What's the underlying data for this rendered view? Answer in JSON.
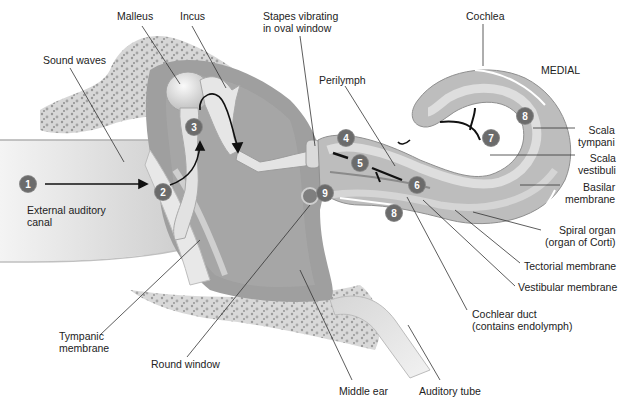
{
  "diagram": {
    "orientation_label": "MEDIAL",
    "labels": [
      {
        "id": "malleus",
        "text": "Malleus",
        "x": 117,
        "y": 10
      },
      {
        "id": "incus",
        "text": "Incus",
        "x": 180,
        "y": 10
      },
      {
        "id": "stapes",
        "text": "Stapes vibrating\nin oval window",
        "x": 263,
        "y": 10
      },
      {
        "id": "cochlea",
        "text": "Cochlea",
        "x": 466,
        "y": 10
      },
      {
        "id": "sound-waves",
        "text": "Sound waves",
        "x": 43,
        "y": 54
      },
      {
        "id": "medial",
        "text": "MEDIAL",
        "x": 541,
        "y": 64
      },
      {
        "id": "perilymph",
        "text": "Perilymph",
        "x": 319,
        "y": 74
      },
      {
        "id": "scala-tympani",
        "text": "Scala\ntympani",
        "x": 578,
        "y": 124
      },
      {
        "id": "scala-vestibuli",
        "text": "Scala\nvestibuli",
        "x": 578,
        "y": 152
      },
      {
        "id": "basilar-membrane",
        "text": "Basilar\nmembrane",
        "x": 565,
        "y": 181
      },
      {
        "id": "external-auditory-canal",
        "text": "External auditory\ncanal",
        "x": 27,
        "y": 204
      },
      {
        "id": "spiral-organ",
        "text": "Spiral organ\n(organ of Corti)",
        "x": 545,
        "y": 224
      },
      {
        "id": "tectorial-membrane",
        "text": "Tectorial membrane",
        "x": 524,
        "y": 260
      },
      {
        "id": "vestibular-membrane",
        "text": "Vestibular membrane",
        "x": 518,
        "y": 281
      },
      {
        "id": "cochlear-duct",
        "text": "Cochlear duct\n(contains endolymph)",
        "x": 472,
        "y": 308
      },
      {
        "id": "tympanic-membrane",
        "text": "Tympanic\nmembrane",
        "x": 59,
        "y": 330
      },
      {
        "id": "round-window",
        "text": "Round window",
        "x": 151,
        "y": 358
      },
      {
        "id": "middle-ear",
        "text": "Middle ear",
        "x": 339,
        "y": 385
      },
      {
        "id": "auditory-tube",
        "text": "Auditory tube",
        "x": 419,
        "y": 385
      }
    ],
    "markers": [
      {
        "n": "1",
        "x": 20,
        "y": 176
      },
      {
        "n": "2",
        "x": 155,
        "y": 184
      },
      {
        "n": "3",
        "x": 186,
        "y": 119
      },
      {
        "n": "4",
        "x": 338,
        "y": 130
      },
      {
        "n": "5",
        "x": 352,
        "y": 155
      },
      {
        "n": "6",
        "x": 409,
        "y": 177
      },
      {
        "n": "7",
        "x": 483,
        "y": 130
      },
      {
        "n": "8",
        "x": 517,
        "y": 108
      },
      {
        "n": "8",
        "x": 386,
        "y": 205
      },
      {
        "n": "9",
        "x": 317,
        "y": 185
      }
    ],
    "colors": {
      "marker_fill": "#6b6b6b",
      "tissue_light": "#d9d9d9",
      "tissue_mid": "#b5b5b5",
      "tissue_dark": "#8e8e8e",
      "bone": "#c8c8c8",
      "label_text": "#222222",
      "leader_line": "#333333"
    }
  }
}
